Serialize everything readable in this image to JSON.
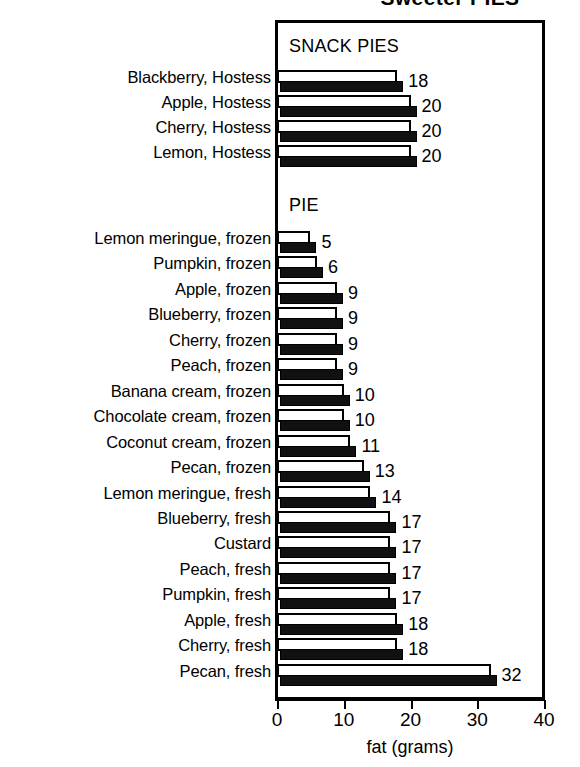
{
  "chart_data": {
    "type": "bar",
    "orientation": "horizontal",
    "title": "Sweeter PIES",
    "xlabel": "fat (grams)",
    "ylabel": "",
    "xlim": [
      0,
      40
    ],
    "xticks": [
      0,
      10,
      20,
      30,
      40
    ],
    "xtick_labels": [
      "0",
      "10",
      "20",
      "30",
      "40"
    ],
    "grid": false,
    "legend": null,
    "groups": [
      {
        "caption": "SNACK PIES",
        "categories": [
          "Blackberry, Hostess",
          "Apple, Hostess",
          "Cherry, Hostess",
          "Lemon, Hostess"
        ],
        "values": [
          18,
          20,
          20,
          20
        ],
        "value_labels": [
          "18",
          "20",
          "20",
          "20"
        ]
      },
      {
        "caption": "PIE",
        "categories": [
          "Lemon meringue, frozen",
          "Pumpkin, frozen",
          "Apple, frozen",
          "Blueberry, frozen",
          "Cherry, frozen",
          "Peach, frozen",
          "Banana cream, frozen",
          "Chocolate cream, frozen",
          "Coconut cream, frozen",
          "Pecan, frozen",
          "Lemon meringue, fresh",
          "Blueberry, fresh",
          "Custard",
          "Peach, fresh",
          "Pumpkin, fresh",
          "Apple, fresh",
          "Cherry, fresh",
          "Pecan, fresh"
        ],
        "values": [
          5,
          6,
          9,
          9,
          9,
          9,
          10,
          10,
          11,
          13,
          14,
          17,
          17,
          17,
          17,
          18,
          18,
          32
        ],
        "value_labels": [
          "5",
          "6",
          "9",
          "9",
          "9",
          "9",
          "10",
          "10",
          "11",
          "13",
          "14",
          "17",
          "17",
          "17",
          "17",
          "18",
          "18",
          "32"
        ]
      }
    ],
    "colors": {
      "bar_outline": "#000000",
      "bar_fill_white": "#ffffff",
      "bar_fill_black": "#111111",
      "axis": "#000000",
      "text": "#000000",
      "background": "#ffffff"
    }
  }
}
